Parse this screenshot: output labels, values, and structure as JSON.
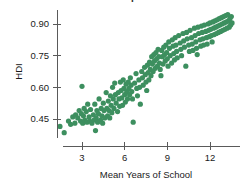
{
  "figure": {
    "title_partial": "Scatterplot",
    "background_color": "#ffffff"
  },
  "chart_data": {
    "type": "scatter",
    "title": "",
    "xlabel": "Mean Years of School",
    "ylabel": "HDI",
    "xlim": [
      1.0,
      14.0
    ],
    "ylim": [
      0.36,
      0.97
    ],
    "xticks": [
      3,
      6,
      9,
      12
    ],
    "yticks": [
      0.45,
      0.6,
      0.75,
      0.9
    ],
    "xtick_labels": [
      "3",
      "6",
      "9",
      "12"
    ],
    "ytick_labels": [
      "0.45",
      "0.60",
      "0.75",
      "0.90"
    ],
    "grid": false,
    "legend": null,
    "marker_color": "#3d8f5f",
    "marker_size": 2.6,
    "n_points": 201,
    "x": [
      1.45,
      1.75,
      2.05,
      2.2,
      2.35,
      2.5,
      2.55,
      2.7,
      2.8,
      2.9,
      2.95,
      3.0,
      3.05,
      3.1,
      3.15,
      3.2,
      3.3,
      3.35,
      3.4,
      3.5,
      3.55,
      3.6,
      3.7,
      3.8,
      3.85,
      3.9,
      3.95,
      4.0,
      4.05,
      4.1,
      4.15,
      4.2,
      4.3,
      4.35,
      4.4,
      4.45,
      4.5,
      4.55,
      4.6,
      4.7,
      4.75,
      4.8,
      4.85,
      4.9,
      4.95,
      5.0,
      5.05,
      5.1,
      5.15,
      5.2,
      5.25,
      5.3,
      5.35,
      5.4,
      5.5,
      5.55,
      5.6,
      5.65,
      5.7,
      5.75,
      5.8,
      5.85,
      5.9,
      5.95,
      6.0,
      6.05,
      6.1,
      6.15,
      6.2,
      6.25,
      6.3,
      6.35,
      6.4,
      6.45,
      6.5,
      6.55,
      6.6,
      6.7,
      6.8,
      6.85,
      6.9,
      7.0,
      7.05,
      7.1,
      7.2,
      7.25,
      7.3,
      7.4,
      7.45,
      7.5,
      7.55,
      7.6,
      7.65,
      7.7,
      7.75,
      7.8,
      7.85,
      7.9,
      7.95,
      8.0,
      8.05,
      8.1,
      8.15,
      8.2,
      8.25,
      8.3,
      8.35,
      8.4,
      8.45,
      8.5,
      8.55,
      8.6,
      8.65,
      8.7,
      8.75,
      8.8,
      8.85,
      8.9,
      8.95,
      9.0,
      9.05,
      9.1,
      9.15,
      9.2,
      9.3,
      9.35,
      9.4,
      9.45,
      9.5,
      9.55,
      9.6,
      9.65,
      9.7,
      9.8,
      9.9,
      9.95,
      10.0,
      10.1,
      10.15,
      10.2,
      10.3,
      10.35,
      10.4,
      10.5,
      10.55,
      10.6,
      10.7,
      10.75,
      10.8,
      10.9,
      10.95,
      11.0,
      11.05,
      11.1,
      11.15,
      11.2,
      11.3,
      11.35,
      11.4,
      11.45,
      11.5,
      11.55,
      11.6,
      11.7,
      11.75,
      11.8,
      11.85,
      11.9,
      11.95,
      12.0,
      12.05,
      12.1,
      12.15,
      12.2,
      12.25,
      12.3,
      12.35,
      12.4,
      12.45,
      12.5,
      12.55,
      12.6,
      12.65,
      12.7,
      12.75,
      12.8,
      12.85,
      12.9,
      12.95,
      13.0,
      13.05,
      13.1,
      13.15,
      13.2,
      13.25,
      13.3,
      13.35,
      13.4,
      13.45,
      13.5,
      13.55
    ],
    "y": [
      0.415,
      0.385,
      0.44,
      0.425,
      0.46,
      0.43,
      0.47,
      0.455,
      0.49,
      0.44,
      0.475,
      0.605,
      0.43,
      0.465,
      0.5,
      0.445,
      0.485,
      0.435,
      0.52,
      0.46,
      0.44,
      0.495,
      0.43,
      0.47,
      0.445,
      0.52,
      0.395,
      0.455,
      0.49,
      0.435,
      0.475,
      0.545,
      0.445,
      0.5,
      0.465,
      0.43,
      0.525,
      0.49,
      0.455,
      0.575,
      0.5,
      0.465,
      0.535,
      0.49,
      0.455,
      0.56,
      0.515,
      0.48,
      0.6,
      0.545,
      0.5,
      0.62,
      0.565,
      0.525,
      0.485,
      0.575,
      0.545,
      0.51,
      0.625,
      0.585,
      0.55,
      0.515,
      0.635,
      0.595,
      0.565,
      0.53,
      0.615,
      0.58,
      0.545,
      0.625,
      0.595,
      0.565,
      0.645,
      0.61,
      0.58,
      0.545,
      0.435,
      0.62,
      0.665,
      0.595,
      0.56,
      0.635,
      0.6,
      0.52,
      0.675,
      0.645,
      0.61,
      0.695,
      0.66,
      0.625,
      0.585,
      0.705,
      0.67,
      0.635,
      0.72,
      0.685,
      0.655,
      0.745,
      0.71,
      0.675,
      0.755,
      0.725,
      0.69,
      0.765,
      0.735,
      0.7,
      0.78,
      0.745,
      0.715,
      0.685,
      0.655,
      0.775,
      0.745,
      0.71,
      0.79,
      0.755,
      0.725,
      0.8,
      0.765,
      0.735,
      0.7,
      0.815,
      0.785,
      0.75,
      0.715,
      0.825,
      0.795,
      0.76,
      0.73,
      0.835,
      0.8,
      0.77,
      0.74,
      0.845,
      0.81,
      0.78,
      0.75,
      0.855,
      0.82,
      0.79,
      0.7,
      0.86,
      0.83,
      0.8,
      0.77,
      0.87,
      0.835,
      0.805,
      0.775,
      0.88,
      0.845,
      0.815,
      0.785,
      0.755,
      0.885,
      0.855,
      0.825,
      0.795,
      0.89,
      0.86,
      0.83,
      0.8,
      0.895,
      0.865,
      0.835,
      0.805,
      0.9,
      0.87,
      0.84,
      0.905,
      0.875,
      0.845,
      0.815,
      0.91,
      0.88,
      0.85,
      0.915,
      0.885,
      0.855,
      0.92,
      0.89,
      0.86,
      0.925,
      0.895,
      0.865,
      0.93,
      0.9,
      0.87,
      0.935,
      0.905,
      0.875,
      0.94,
      0.91,
      0.88,
      0.945,
      0.915,
      0.885,
      0.925,
      0.895,
      0.935,
      0.905
    ]
  }
}
